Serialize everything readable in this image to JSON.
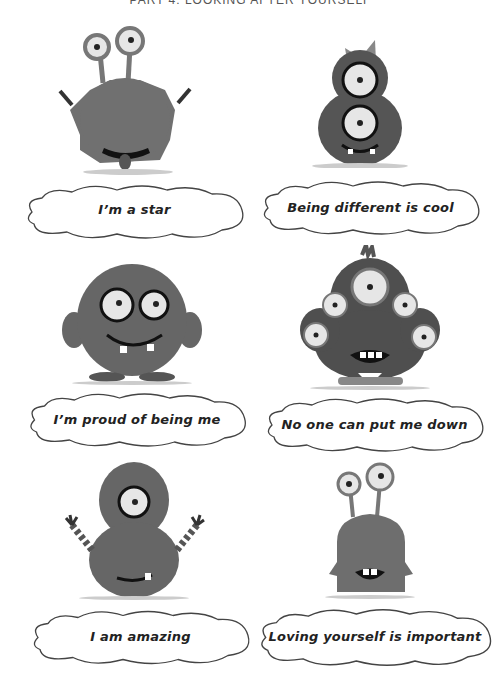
{
  "header": {
    "title": "PART 4: LOOKING AFTER YOURSELF"
  },
  "colors": {
    "fur": "#6e6e6e",
    "fur_dark": "#4f4f4f",
    "eye_white": "#e6e6e6",
    "outline": "#222222",
    "background": "#ffffff"
  },
  "cards": [
    {
      "affirmation": "I’m a star",
      "monster": "two-eyestalk-furry-monster-with-tongue"
    },
    {
      "affirmation": "Being different is cool",
      "monster": "two-eyed-furry-monster-with-bow"
    },
    {
      "affirmation": "I’m proud of being me",
      "monster": "round-furry-monster-with-glasses-eyes"
    },
    {
      "affirmation": "No one can put me down",
      "monster": "five-eyed-furry-monster"
    },
    {
      "affirmation": "I am amazing",
      "monster": "one-eyed-furry-monster-waving"
    },
    {
      "affirmation": "Loving yourself is important",
      "monster": "smooth-eyestalk-monster"
    }
  ]
}
